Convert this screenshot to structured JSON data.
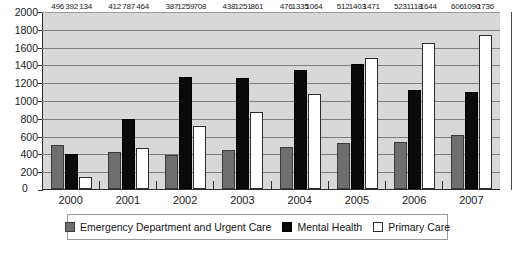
{
  "chart_data": {
    "type": "bar",
    "title": "",
    "subtitle": "",
    "xlabel": "",
    "ylabel": "",
    "categories": [
      "2000",
      "2001",
      "2002",
      "2003",
      "2004",
      "2005",
      "2006",
      "2007"
    ],
    "series": [
      {
        "name": "Emergency Department and Urgent Care",
        "color": "#6e6e6e",
        "values": [
          496,
          412,
          387,
          438,
          476,
          512,
          523,
          606
        ]
      },
      {
        "name": "Mental Health",
        "color": "#0a0a0a",
        "values": [
          392,
          787,
          1259,
          1251,
          1335,
          1403,
          1118,
          1090
        ]
      },
      {
        "name": "Primary Care",
        "color": "#ffffff",
        "values": [
          134,
          464,
          708,
          861,
          1064,
          1471,
          1644,
          1736
        ]
      }
    ],
    "ylim": [
      0,
      2000
    ],
    "ytick_step": 200,
    "yticks": [
      0,
      200,
      400,
      600,
      800,
      1000,
      1200,
      1400,
      1600,
      1800,
      2000
    ],
    "ytick_labels": [
      "0",
      "200",
      "400",
      "600",
      "800",
      "1000",
      "1200",
      "1400",
      "1600",
      "1800",
      "2000"
    ],
    "grid": true,
    "legend_position": "bottom",
    "data_labels": true,
    "plot_background": "#d8d8d8"
  }
}
